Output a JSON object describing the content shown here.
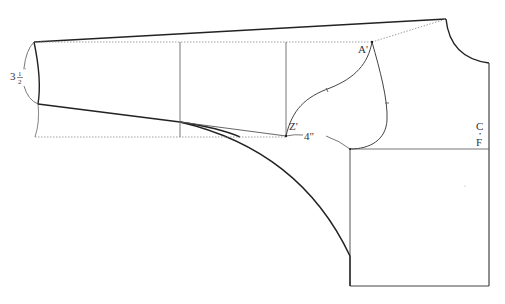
{
  "diagram": {
    "type": "sewing pattern draft (sleeve / bodice)",
    "labels": {
      "point_a": "A'",
      "point_z": "Z'",
      "measure_4": "4\"",
      "measure_3_whole": "3",
      "measure_3_num": "1",
      "measure_3_den": "2",
      "measure_3_inch": "\"",
      "center_front_c": "C",
      "center_front_f": "F"
    },
    "colors": {
      "bold_line": "#222222",
      "thin_line": "#555555",
      "dotted_line": "#777777",
      "background": "#ffffff"
    }
  }
}
